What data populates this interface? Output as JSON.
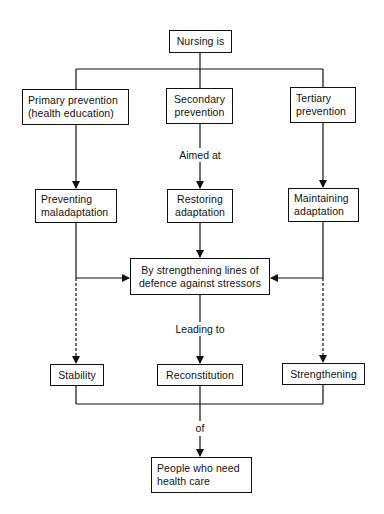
{
  "diagram": {
    "root": {
      "label": "Nursing is"
    },
    "prevention": [
      {
        "id": "primary",
        "lines": [
          "Primary prevention",
          "(health education)"
        ]
      },
      {
        "id": "secondary",
        "lines": [
          "Secondary",
          "prevention"
        ]
      },
      {
        "id": "tertiary",
        "lines": [
          "Tertiary",
          "prevention"
        ]
      }
    ],
    "connector_aimed_at": "Aimed at",
    "goals": [
      {
        "id": "preventing",
        "lines": [
          "Preventing",
          "maladaptation"
        ]
      },
      {
        "id": "restoring",
        "lines": [
          "Restoring",
          "adaptation"
        ]
      },
      {
        "id": "maintaining",
        "lines": [
          "Maintaining",
          "adaptation"
        ]
      }
    ],
    "method": {
      "lines": [
        "By strengthening lines of",
        "defence against stressors"
      ]
    },
    "connector_leading_to": "Leading to",
    "outcomes": [
      {
        "id": "stability",
        "label": "Stability"
      },
      {
        "id": "reconstitution",
        "label": "Reconstitution"
      },
      {
        "id": "strengthening",
        "label": "Strengthening"
      }
    ],
    "connector_of": "of",
    "target": {
      "lines": [
        "People who need",
        "health care"
      ]
    },
    "colors": {
      "line": "#111111",
      "background": "#ffffff"
    }
  }
}
